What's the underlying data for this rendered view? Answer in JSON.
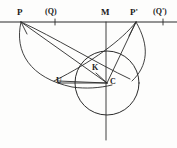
{
  "figure": {
    "kind": "geometric-construction-diagram",
    "background_color": "#fdfdfc",
    "stroke_color": "#2b2b2b",
    "label_color": "#1a1a1a"
  },
  "labels": {
    "p": "P",
    "q_left": "(Q)",
    "m": "M",
    "p_prime": "P'",
    "q_right": "(Q')",
    "k": "K",
    "c": "C",
    "u": "U"
  },
  "points": {
    "P": {
      "x": 21,
      "y": 22
    },
    "Q": {
      "x": 55,
      "y": 22
    },
    "M": {
      "x": 106,
      "y": 22
    },
    "P2": {
      "x": 136,
      "y": 22
    },
    "Q2": {
      "x": 163,
      "y": 22
    },
    "C": {
      "x": 107,
      "y": 83
    },
    "K": {
      "x": 97,
      "y": 72
    },
    "U": {
      "x": 64,
      "y": 83
    }
  },
  "main_circle": {
    "cx": 107,
    "cy": 83,
    "r": 32
  },
  "baseline": {
    "x1": 0,
    "x2": 177,
    "y": 22
  },
  "vertical_axis": {
    "x": 106,
    "y1": 22,
    "y2": 140
  },
  "tick_marks": [
    {
      "x": 55,
      "y": 22,
      "h": 5
    },
    {
      "x": 163,
      "y": 22,
      "h": 5
    }
  ],
  "segments": [
    {
      "name": "P-to-C",
      "x1": 21,
      "y1": 22,
      "x2": 107,
      "y2": 83
    },
    {
      "name": "P-to-U",
      "x1": 21,
      "y1": 22,
      "x2": 64,
      "y2": 83
    },
    {
      "name": "Pp-to-C",
      "x1": 136,
      "y1": 22,
      "x2": 107,
      "y2": 83
    },
    {
      "name": "Pp-to-K",
      "x1": 136,
      "y1": 22,
      "x2": 96,
      "y2": 74
    },
    {
      "name": "U-to-C",
      "x1": 64,
      "y1": 83,
      "x2": 107,
      "y2": 83
    },
    {
      "name": "K-to-C",
      "x1": 97,
      "y1": 73,
      "x2": 107,
      "y2": 83
    }
  ],
  "arcs": [
    {
      "name": "arc-P-U-big",
      "d": "M 21 22 C 16 55, 36 80, 88 86"
    },
    {
      "name": "arc-P-right",
      "d": "M 21 22 C 48 38, 96 68, 128 80"
    },
    {
      "name": "arc-Pp-left",
      "d": "M 136 22 C 124 38, 96 56, 56 80"
    },
    {
      "name": "arc-Pp-down",
      "d": "M 136 22 C 146 44, 146 62, 133 80"
    }
  ],
  "label_positions": {
    "p": {
      "x": 17,
      "y": 8
    },
    "q_left": {
      "x": 47,
      "y": 8
    },
    "m": {
      "x": 101,
      "y": 8
    },
    "p_prime": {
      "x": 131,
      "y": 8
    },
    "q_right": {
      "x": 155,
      "y": 8
    },
    "k": {
      "x": 93,
      "y": 64
    },
    "c": {
      "x": 110,
      "y": 78
    },
    "u": {
      "x": 56,
      "y": 77
    }
  }
}
